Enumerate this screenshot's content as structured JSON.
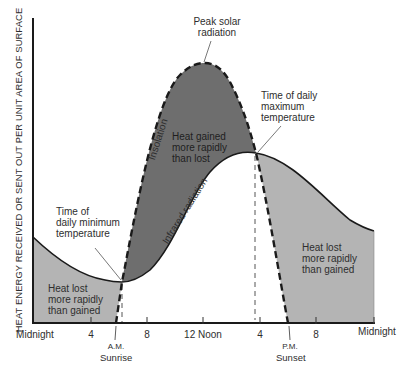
{
  "diagram": {
    "y_axis_label": "HEAT ENERGY RECEIVED OR SENT OUT PER UNIT AREA OF SURFACE",
    "x_axis_ticks": [
      {
        "label": "Midnight",
        "x": 33
      },
      {
        "label": "4",
        "x": 91
      },
      {
        "label": "8",
        "x": 147
      },
      {
        "label": "12 Noon",
        "x": 203
      },
      {
        "label": "4",
        "x": 260
      },
      {
        "label": "8",
        "x": 316
      },
      {
        "label": "Midnight",
        "x": 374
      }
    ],
    "markers": {
      "sunrise_top": "A.M.",
      "sunrise_bottom": "Sunrise",
      "sunset_top": "P.M.",
      "sunset_bottom": "Sunset"
    },
    "annotations": {
      "peak_solar_line1": "Peak solar",
      "peak_solar_line2": "radiation",
      "max_temp_line1": "Time of daily",
      "max_temp_line2": "maximum",
      "max_temp_line3": "temperature",
      "min_temp_line1": "Time of",
      "min_temp_line2": "daily minimum",
      "min_temp_line3": "temperature"
    },
    "curves": {
      "insolation": "Insolation",
      "infrared": "Infrared radiation"
    },
    "regions": {
      "gain_line1": "Heat gained",
      "gain_line2": "more rapidly",
      "gain_line3": "than lost",
      "loss_left_line1": "Heat lost",
      "loss_left_line2": "more rapidly",
      "loss_left_line3": "than gained",
      "loss_right_line1": "Heat lost",
      "loss_right_line2": "more rapidly",
      "loss_right_line3": "than gained"
    },
    "colors": {
      "gain_fill": "#6e6e6e",
      "loss_fill": "#b4b4b4",
      "line": "#1a1a1a"
    }
  }
}
